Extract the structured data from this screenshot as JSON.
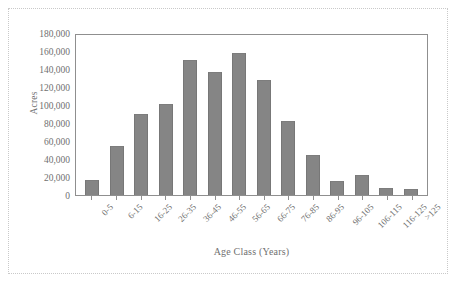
{
  "chart_data": {
    "type": "bar",
    "title": "",
    "xlabel": "Age Class (Years)",
    "ylabel": "Acres",
    "categories": [
      "0-5",
      "6-15",
      "16-25",
      "26-35",
      "36-45",
      "46-55",
      "56-65",
      "66-75",
      "76-85",
      "86-95",
      "96-105",
      "106-115",
      "116-125",
      ">125"
    ],
    "values": [
      17000,
      54000,
      90000,
      101000,
      150000,
      137000,
      158000,
      128000,
      82000,
      45000,
      16000,
      22000,
      8000,
      7000
    ],
    "ylim": [
      0,
      180000
    ],
    "ytick_values": [
      0,
      20000,
      40000,
      60000,
      80000,
      100000,
      120000,
      140000,
      160000,
      180000
    ],
    "ytick_labels": [
      "0",
      "20,000",
      "40,000",
      "60,000",
      "80,000",
      "100,000",
      "120,000",
      "140,000",
      "160,000",
      "180,000"
    ],
    "grid": false,
    "legend": null,
    "bar_color": "#858585",
    "axis_color": "#8f8f8f",
    "text_color": "#707070",
    "background": "#ffffff",
    "border_color": "#c9c9c9"
  }
}
